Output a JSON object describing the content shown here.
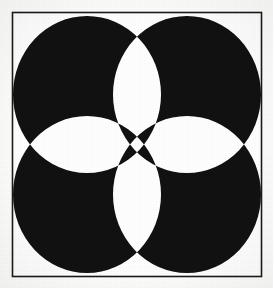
{
  "artwork": {
    "title": "Four-Circle Rosette Pattern",
    "description": "Black and white geometric quilt-block motif formed by four overlapping circles inside a thin square frame, producing eight pointed petals, four white lens shapes and a black concave-sided center.",
    "medium": "line drawing / scanned print",
    "palette": {
      "ink": "#111111",
      "paper": "#fdfdfc",
      "frame_line": "#1a1a1a",
      "page_background": "#ffffff"
    },
    "canvas": {
      "width": 273,
      "height": 288
    },
    "frame": {
      "name": "square-border",
      "x": 12.5,
      "y": 12.5,
      "width": 249,
      "height": 264,
      "stroke_width": 1.6
    },
    "construction": {
      "method": "even-odd overlap of four equal circles",
      "circle_radius_x": 74,
      "circle_radius_y": 78.5,
      "centers": [
        {
          "name": "circle-top-left",
          "cx": 87,
          "cy": 94.5
        },
        {
          "name": "circle-top-right",
          "cx": 187,
          "cy": 94.5
        },
        {
          "name": "circle-bottom-left",
          "cx": 87,
          "cy": 194.5
        },
        {
          "name": "circle-bottom-right",
          "cx": 187,
          "cy": 194.5
        }
      ],
      "node_points": [
        {
          "name": "node-upper-left",
          "x": 87,
          "y": 94.5
        },
        {
          "name": "node-upper-right",
          "x": 187,
          "y": 94.5
        },
        {
          "name": "node-lower-left",
          "x": 87,
          "y": 194.5
        },
        {
          "name": "node-lower-right",
          "x": 187,
          "y": 194.5
        }
      ],
      "petal_count": 8,
      "white_lens_count": 4,
      "center_shape": "concave-sided square (astroid)"
    }
  }
}
